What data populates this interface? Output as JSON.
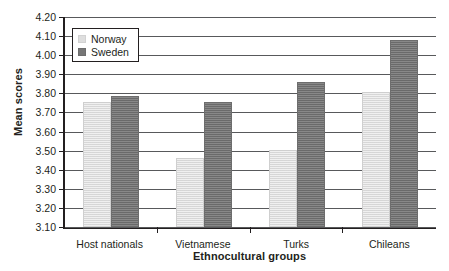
{
  "chart_data": {
    "type": "bar",
    "title": "",
    "xlabel": "Ethnocultural groups",
    "ylabel": "Mean scores",
    "categories": [
      "Host nationals",
      "Vietnamese",
      "Turks",
      "Chileans"
    ],
    "series": [
      {
        "name": "Norway",
        "color": "#dedede",
        "values": [
          3.75,
          3.46,
          3.5,
          3.8
        ]
      },
      {
        "name": "Sweden",
        "color": "#767676",
        "values": [
          3.78,
          3.75,
          3.85,
          4.07
        ]
      }
    ],
    "ylim": [
      3.1,
      4.2
    ],
    "ytick_step": 0.1,
    "yticks": [
      "4.20",
      "4.10",
      "4.00",
      "3.90",
      "3.80",
      "3.70",
      "3.60",
      "3.50",
      "3.40",
      "3.30",
      "3.20",
      "3.10"
    ],
    "grid": true,
    "legend_position": "top-left"
  }
}
